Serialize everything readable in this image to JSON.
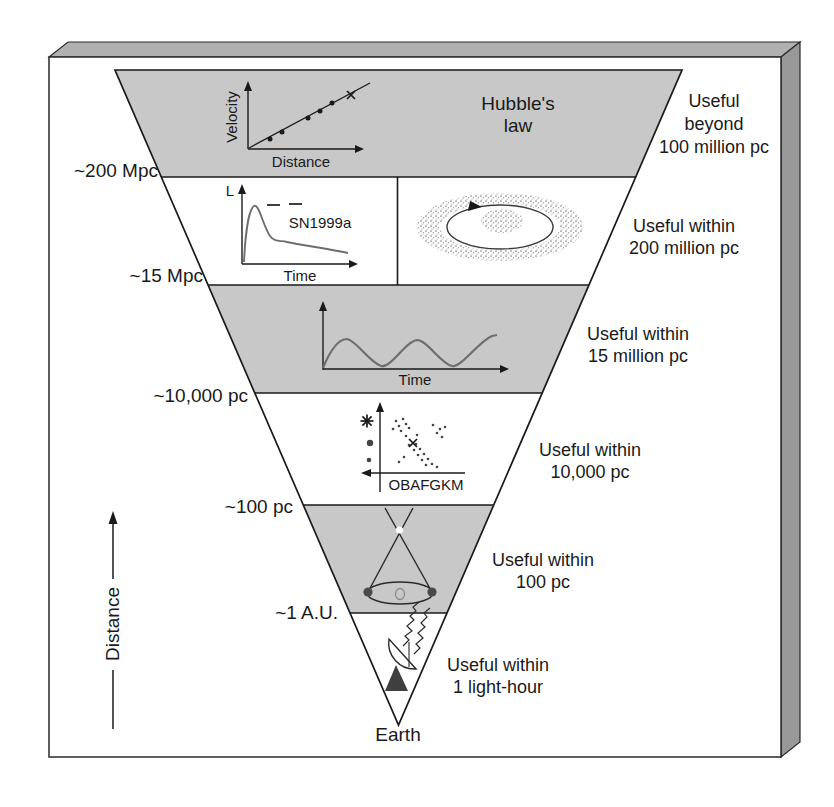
{
  "colors": {
    "band_shaded": "#c8c8c8",
    "band_light": "#ffffff",
    "slab_top_face": "#b0b0b0",
    "slab_side_face": "#999999",
    "ink": "#1a1a1a",
    "curve_gray": "#6e6e6e"
  },
  "ladder": {
    "apex_label": "Earth",
    "distance_arrow_label": "Distance",
    "boundary_labels": [
      "~200 Mpc",
      "~15 Mpc",
      "~10,000 pc",
      "~100 pc",
      "~1 A.U."
    ],
    "levels": [
      {
        "name": "hubble-law",
        "title_lines": [
          "Hubble's",
          "law"
        ],
        "range_lines": [
          "Useful",
          "beyond",
          "100 million pc"
        ]
      },
      {
        "name": "supernova-and-galaxy-rotation",
        "range_lines": [
          "Useful within",
          "200 million pc"
        ]
      },
      {
        "name": "cepheid-variable",
        "range_lines": [
          "Useful within",
          "15 million pc"
        ]
      },
      {
        "name": "hr-diagram-spectroscopic-parallax",
        "range_lines": [
          "Useful within",
          "10,000 pc"
        ]
      },
      {
        "name": "trigonometric-parallax",
        "range_lines": [
          "Useful within",
          "100 pc"
        ]
      },
      {
        "name": "radar-ranging",
        "range_lines": [
          "Useful within",
          "1 light-hour"
        ]
      }
    ]
  },
  "plots": {
    "hubble": {
      "ylabel": "Velocity",
      "xlabel": "Distance"
    },
    "supernova": {
      "ylabel": "L",
      "xlabel": "Time",
      "annotation": "SN1999a"
    },
    "cepheid": {
      "xlabel": "Time"
    },
    "hr": {
      "xlabel": "OBAFGKM"
    }
  }
}
